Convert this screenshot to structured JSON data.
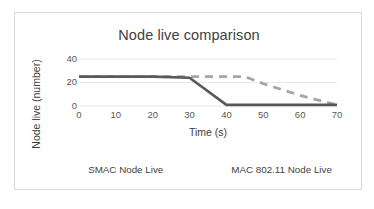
{
  "chart_data": {
    "type": "line",
    "title": "Node live comparison",
    "xlabel": "Time (s)",
    "ylabel": "Node live (number)",
    "xlim": [
      0,
      70
    ],
    "ylim": [
      0,
      40
    ],
    "xticks": [
      0,
      10,
      20,
      30,
      40,
      50,
      60,
      70
    ],
    "yticks": [
      0,
      20,
      40
    ],
    "grid": "horizontal",
    "legend_position": "bottom",
    "series": [
      {
        "name": "SMAC Node Live",
        "color": "#a6a6a6",
        "style": "dashed",
        "x": [
          0,
          10,
          20,
          30,
          40,
          45,
          50,
          60,
          70
        ],
        "y": [
          25,
          25,
          25,
          25,
          25,
          25,
          19,
          9,
          1
        ]
      },
      {
        "name": "MAC 802.11 Node Live",
        "color": "#595959",
        "style": "solid",
        "x": [
          0,
          10,
          20,
          30,
          40,
          50,
          60,
          70
        ],
        "y": [
          25,
          25,
          25,
          24,
          1,
          1,
          1,
          1
        ]
      }
    ]
  },
  "colors": {
    "frame_border": "#d9d9d9",
    "gridline": "#e8e8e8",
    "title_text": "#404040",
    "tick_text": "#595959",
    "smac": "#a6a6a6",
    "mac80211": "#595959"
  },
  "xtick_labels": [
    "0",
    "10",
    "20",
    "30",
    "40",
    "50",
    "60",
    "70"
  ],
  "ytick_labels": [
    "0",
    "20",
    "40"
  ],
  "legend": {
    "items": [
      {
        "label": "SMAC Node Live"
      },
      {
        "label": "MAC 802.11 Node Live"
      }
    ]
  }
}
